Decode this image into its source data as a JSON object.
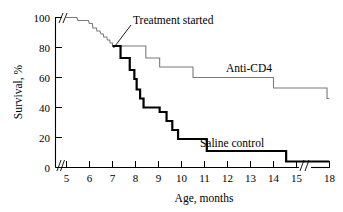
{
  "chart_data": {
    "type": "line",
    "title": "",
    "xlabel": "Age, months",
    "ylabel": "Survival, %",
    "xlim": [
      4.6,
      18
    ],
    "ylim": [
      0,
      100
    ],
    "grid": false,
    "legend_position": "inline-labels",
    "x_ticks": [
      5,
      6,
      7,
      8,
      9,
      10,
      11,
      12,
      13,
      14,
      15,
      18
    ],
    "y_ticks": [
      0,
      20,
      40,
      60,
      80,
      100
    ],
    "axis_breaks": {
      "x_break_between": [
        15,
        18
      ],
      "y_break_note": "break mark at top of y-axis near 100%"
    },
    "annotations": [
      {
        "text": "Treatment started",
        "points_to_x": 7.0,
        "points_to_y": 81
      }
    ],
    "series": [
      {
        "name": "Anti-CD4",
        "style": "thin",
        "color": "#7b7b7b",
        "steps": [
          [
            4.95,
            100
          ],
          [
            5.45,
            100
          ],
          [
            5.5,
            98
          ],
          [
            5.95,
            98
          ],
          [
            6.0,
            96
          ],
          [
            6.12,
            96
          ],
          [
            6.15,
            93
          ],
          [
            6.3,
            93
          ],
          [
            6.32,
            91
          ],
          [
            6.45,
            91
          ],
          [
            6.5,
            89
          ],
          [
            6.6,
            89
          ],
          [
            6.62,
            87
          ],
          [
            6.75,
            87
          ],
          [
            6.78,
            85
          ],
          [
            6.88,
            85
          ],
          [
            6.9,
            83
          ],
          [
            7.0,
            83
          ],
          [
            7.0,
            81
          ],
          [
            8.45,
            81
          ],
          [
            8.45,
            73
          ],
          [
            9.05,
            73
          ],
          [
            9.05,
            67
          ],
          [
            10.5,
            67
          ],
          [
            10.5,
            60
          ],
          [
            14.0,
            60
          ],
          [
            14.0,
            53
          ],
          [
            15.4,
            53
          ],
          [
            17.6,
            53
          ],
          [
            17.6,
            46
          ],
          [
            18.0,
            46
          ]
        ]
      },
      {
        "name": "Saline control",
        "style": "thick",
        "color": "#000000",
        "steps": [
          [
            7.0,
            81
          ],
          [
            7.35,
            81
          ],
          [
            7.35,
            73
          ],
          [
            7.75,
            73
          ],
          [
            7.75,
            65
          ],
          [
            7.95,
            65
          ],
          [
            7.95,
            59
          ],
          [
            8.05,
            59
          ],
          [
            8.05,
            52
          ],
          [
            8.2,
            52
          ],
          [
            8.2,
            46
          ],
          [
            8.35,
            46
          ],
          [
            8.35,
            40
          ],
          [
            9.05,
            40
          ],
          [
            9.05,
            37
          ],
          [
            9.35,
            37
          ],
          [
            9.35,
            31
          ],
          [
            9.6,
            31
          ],
          [
            9.6,
            25
          ],
          [
            9.85,
            25
          ],
          [
            9.85,
            19
          ],
          [
            11.1,
            19
          ],
          [
            11.1,
            11
          ],
          [
            14.55,
            11
          ],
          [
            14.55,
            4
          ],
          [
            15.4,
            4
          ],
          [
            17.6,
            4
          ],
          [
            18.0,
            4
          ]
        ]
      }
    ]
  },
  "axes": {
    "y_title": "Survival, %",
    "x_title": "Age, months",
    "y_tick_labels": [
      "100",
      "80",
      "60",
      "40",
      "20",
      "0"
    ],
    "x_tick_labels": [
      "5",
      "6",
      "7",
      "8",
      "9",
      "10",
      "11",
      "12",
      "13",
      "14",
      "15",
      "18"
    ]
  },
  "labels": {
    "anti_cd4": "Anti-CD4",
    "saline_control": "Saline control",
    "treatment_started": "Treatment started"
  }
}
